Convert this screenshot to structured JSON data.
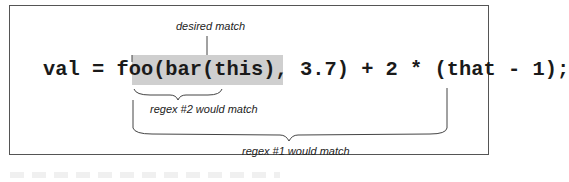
{
  "diagram": {
    "code_line": "val = foo(bar(this), 3.7) + 2 * (that - 1);",
    "highlighted_segment": "(bar(this), 3.7)",
    "annotations": {
      "desired": "desired match",
      "regex2": "regex #2 would match",
      "regex1": "regex #1 would match"
    },
    "colors": {
      "highlight": "#cfcfcf",
      "frame": "#555555",
      "text": "#1a1a1a"
    }
  }
}
